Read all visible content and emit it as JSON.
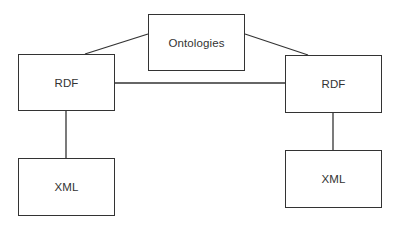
{
  "diagram": {
    "nodes": [
      {
        "id": "ontologies",
        "label": "Ontologies",
        "x": 148,
        "y": 14,
        "w": 97,
        "h": 57
      },
      {
        "id": "rdf_left",
        "label": "RDF",
        "x": 18,
        "y": 54,
        "w": 97,
        "h": 57
      },
      {
        "id": "rdf_right",
        "label": "RDF",
        "x": 285,
        "y": 55,
        "w": 97,
        "h": 58
      },
      {
        "id": "xml_left",
        "label": "XML",
        "x": 18,
        "y": 158,
        "w": 97,
        "h": 58
      },
      {
        "id": "xml_right",
        "label": "XML",
        "x": 285,
        "y": 150,
        "w": 97,
        "h": 58
      }
    ],
    "edges": [
      {
        "from": "ontologies",
        "to": "rdf_left"
      },
      {
        "from": "ontologies",
        "to": "rdf_right"
      },
      {
        "from": "rdf_left",
        "to": "rdf_right"
      },
      {
        "from": "rdf_left",
        "to": "xml_left"
      },
      {
        "from": "rdf_right",
        "to": "xml_right"
      }
    ],
    "colors": {
      "stroke": "#333333",
      "background": "#ffffff",
      "text": "#333333"
    }
  }
}
